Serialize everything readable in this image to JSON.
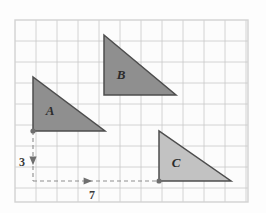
{
  "figure": {
    "background_color": "#fdfdfd",
    "frame": {
      "x": 15,
      "y": 20,
      "width": 233,
      "height": 182,
      "border_color": "#d2d2d2",
      "fill_color": "#fcfcfc"
    },
    "grid": {
      "cell_size": 21,
      "columns": 11,
      "rows": 8,
      "line_color": "#c9c9c9",
      "line_width": 0.8,
      "grid_on": true
    }
  },
  "shapes": [
    {
      "name": "triangle-a",
      "label": "A",
      "label_x": 50,
      "label_y": 115,
      "points": "33,77 33,131 105,131",
      "fill": "#8f8f8f",
      "stroke": "#4d4d4d",
      "vertices": [
        [
          33,
          77
        ],
        [
          33,
          131
        ],
        [
          105,
          131
        ]
      ],
      "legs": {
        "vertical": 54,
        "horizontal": 72
      }
    },
    {
      "name": "triangle-b",
      "label": "B",
      "label_x": 121,
      "label_y": 79,
      "points": "104,35 104,95 176,95",
      "fill": "#8f8f8f",
      "stroke": "#4d4d4d",
      "vertices": [
        [
          104,
          35
        ],
        [
          104,
          95
        ],
        [
          176,
          95
        ]
      ],
      "legs": {
        "vertical": 60,
        "horizontal": 72
      }
    },
    {
      "name": "triangle-c",
      "label": "C",
      "label_x": 176,
      "label_y": 167,
      "points": "159,131 159,181 231,181",
      "fill": "#c2c2c2",
      "stroke": "#4d4d4d",
      "vertices": [
        [
          159,
          131
        ],
        [
          159,
          181
        ],
        [
          231,
          181
        ]
      ],
      "legs": {
        "vertical": 50,
        "horizontal": 72
      }
    }
  ],
  "translation": {
    "vertical": {
      "name": "down-3",
      "label": "3",
      "label_x": 22,
      "label_y": 166,
      "from": [
        33,
        131
      ],
      "to": [
        33,
        181
      ],
      "direction": "down",
      "arrow_x": 33,
      "arrow_y": 162,
      "dash_color": "#8d8d8d"
    },
    "horizontal": {
      "name": "right-7",
      "label": "7",
      "label_x": 92,
      "label_y": 199,
      "from": [
        33,
        181
      ],
      "to": [
        159,
        181
      ],
      "direction": "right",
      "arrow_x": 89,
      "arrow_y": 181,
      "dash_color": "#8d8d8d"
    },
    "dash_pattern": "4,3",
    "markers": [
      {
        "name": "start-point",
        "cx": 33,
        "cy": 131,
        "r": 2.6,
        "fill": "#6e6e6e"
      },
      {
        "name": "end-point",
        "cx": 159,
        "cy": 181,
        "r": 2.6,
        "fill": "#6e6e6e"
      }
    ]
  },
  "chart_data": {
    "type": "scatter",
    "xlabel": "",
    "ylabel": "",
    "grid": true,
    "legend": "none",
    "xlim": [
      0,
      11
    ],
    "ylim": [
      0,
      8
    ],
    "annotations": [
      "A",
      "B",
      "C",
      "3",
      "7"
    ],
    "series": [
      {
        "name": "Triangle A",
        "grid_vertices": [
          [
            0.86,
            5.95
          ],
          [
            0.86,
            3.38
          ],
          [
            4.29,
            3.38
          ]
        ],
        "values": [
          5.95,
          3.38,
          3.38
        ],
        "x": [
          0.86,
          0.86,
          4.29
        ]
      },
      {
        "name": "Triangle B",
        "grid_vertices": [
          [
            4.24,
            7.86
          ],
          [
            4.24,
            5.0
          ],
          [
            7.67,
            5.0
          ]
        ],
        "values": [
          7.86,
          5.0,
          5.0
        ],
        "x": [
          4.24,
          4.24,
          7.67
        ]
      },
      {
        "name": "Triangle C",
        "grid_vertices": [
          [
            6.86,
            3.38
          ],
          [
            6.86,
            1.0
          ],
          [
            10.29,
            1.0
          ]
        ],
        "values": [
          3.38,
          1.0,
          1.0
        ],
        "x": [
          6.86,
          6.86,
          10.29
        ]
      }
    ],
    "translation_vector": {
      "right": 7,
      "down": 3
    }
  }
}
